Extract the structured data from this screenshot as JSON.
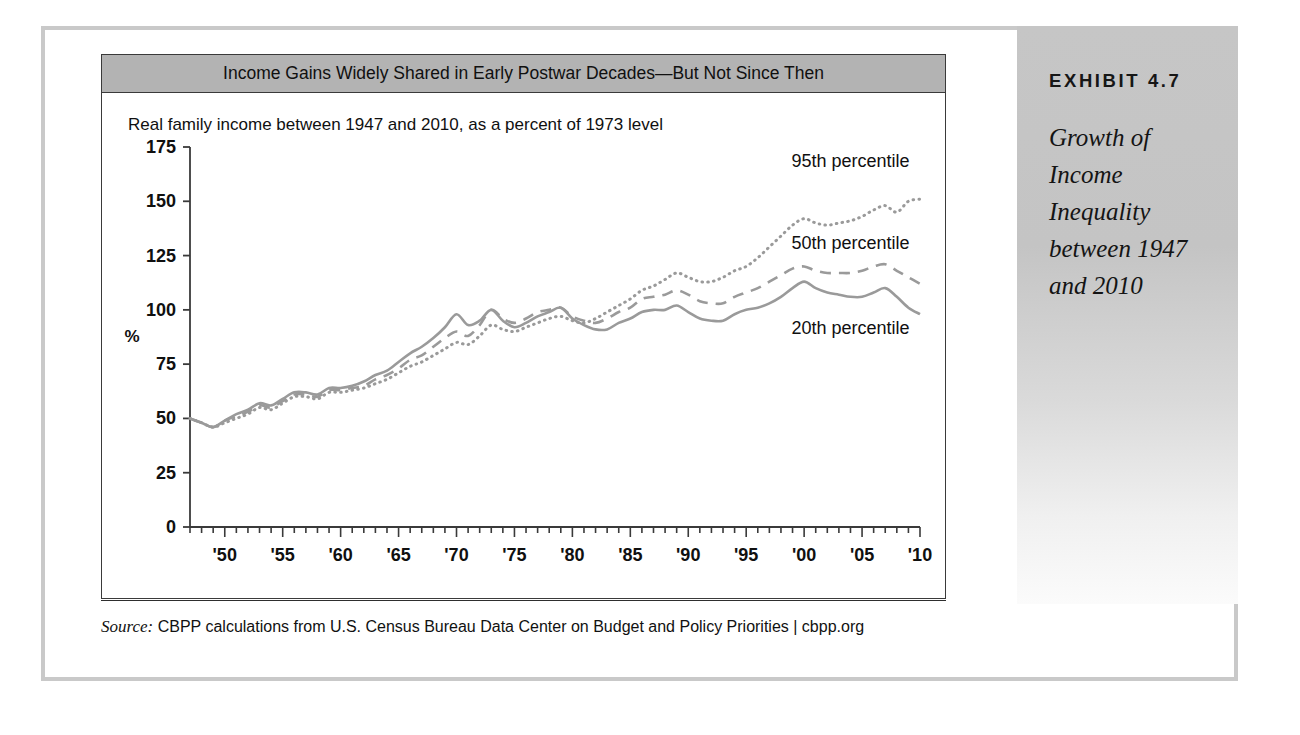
{
  "exhibit": {
    "kicker": "EXHIBIT 4.7",
    "title": "Growth of Income Inequality between 1947 and 2010"
  },
  "card": {
    "header": "Income Gains Widely Shared in Early Postwar Decades—But Not Since Then",
    "subtitle": "Real family income between 1947 and 2010, as a percent of 1973 level"
  },
  "source": {
    "label": "Source:",
    "text": " CBPP calculations from U.S. Census Bureau Data Center on Budget and Policy Priorities | cbpp.org"
  },
  "colors": {
    "line": "#9a9a9a",
    "axis": "#3a3a3a",
    "header_band": "#b3b3b3",
    "sidebar": "#c6c6c6",
    "outer_frame": "#c9c9c9"
  },
  "chart_data": {
    "type": "line",
    "title": "Income Gains Widely Shared in Early Postwar Decades—But Not Since Then",
    "subtitle": "Real family income between 1947 and 2010, as a percent of 1973 level",
    "xlabel": "",
    "ylabel": "%",
    "ylim": [
      0,
      175
    ],
    "yticks": [
      0,
      25,
      50,
      75,
      100,
      125,
      150,
      175
    ],
    "xlim": [
      1947,
      2010
    ],
    "xticks": [
      1950,
      1955,
      1960,
      1965,
      1970,
      1975,
      1980,
      1985,
      1990,
      1995,
      2000,
      2005,
      2010
    ],
    "xticklabels": [
      "'50",
      "'55",
      "'60",
      "'65",
      "'70",
      "'75",
      "'80",
      "'85",
      "'90",
      "'95",
      "'00",
      "'05",
      "'10"
    ],
    "minor_tick_interval": 1,
    "grid": false,
    "legend": "inline-annotations",
    "annotations": [
      {
        "text": "95th percentile",
        "year": 2004,
        "value": 166
      },
      {
        "text": "50th percentile",
        "year": 2004,
        "value": 128
      },
      {
        "text": "20th percentile",
        "year": 2004,
        "value": 89
      }
    ],
    "x": [
      1947,
      1948,
      1949,
      1950,
      1951,
      1952,
      1953,
      1954,
      1955,
      1956,
      1957,
      1958,
      1959,
      1960,
      1961,
      1962,
      1963,
      1964,
      1965,
      1966,
      1967,
      1968,
      1969,
      1970,
      1971,
      1972,
      1973,
      1974,
      1975,
      1976,
      1977,
      1978,
      1979,
      1980,
      1981,
      1982,
      1983,
      1984,
      1985,
      1986,
      1987,
      1988,
      1989,
      1990,
      1991,
      1992,
      1993,
      1994,
      1995,
      1996,
      1997,
      1998,
      1999,
      2000,
      2001,
      2002,
      2003,
      2004,
      2005,
      2006,
      2007,
      2008,
      2009,
      2010
    ],
    "series": [
      {
        "name": "95th percentile",
        "style": "dotted",
        "values": [
          50,
          48,
          46,
          48,
          50,
          52,
          55,
          54,
          57,
          60,
          60,
          59,
          62,
          62,
          63,
          64,
          66,
          68,
          71,
          74,
          76,
          79,
          82,
          85,
          84,
          88,
          93,
          91,
          90,
          92,
          94,
          96,
          97,
          95,
          94,
          96,
          99,
          102,
          105,
          109,
          111,
          114,
          117,
          115,
          113,
          113,
          115,
          118,
          120,
          124,
          129,
          134,
          139,
          142,
          140,
          139,
          140,
          141,
          143,
          146,
          148,
          145,
          150,
          151
        ]
      },
      {
        "name": "50th percentile",
        "style": "dashed",
        "values": [
          50,
          48,
          46,
          49,
          51,
          53,
          56,
          55,
          58,
          61,
          61,
          60,
          63,
          63,
          64,
          65,
          68,
          70,
          73,
          77,
          79,
          83,
          87,
          90,
          88,
          93,
          100,
          96,
          94,
          96,
          99,
          100,
          101,
          97,
          95,
          94,
          96,
          99,
          101,
          105,
          106,
          107,
          109,
          107,
          104,
          103,
          103,
          106,
          108,
          110,
          113,
          116,
          119,
          120,
          118,
          117,
          117,
          117,
          118,
          120,
          121,
          118,
          115,
          112
        ]
      },
      {
        "name": "20th percentile",
        "style": "solid",
        "values": [
          50,
          48,
          46,
          49,
          52,
          54,
          57,
          56,
          59,
          62,
          62,
          61,
          64,
          64,
          65,
          67,
          70,
          72,
          76,
          80,
          83,
          87,
          92,
          98,
          93,
          95,
          100,
          95,
          92,
          94,
          97,
          99,
          101,
          96,
          93,
          91,
          91,
          94,
          96,
          99,
          100,
          100,
          102,
          99,
          96,
          95,
          95,
          98,
          100,
          101,
          103,
          106,
          110,
          113,
          110,
          108,
          107,
          106,
          106,
          108,
          110,
          106,
          101,
          98
        ]
      }
    ]
  }
}
